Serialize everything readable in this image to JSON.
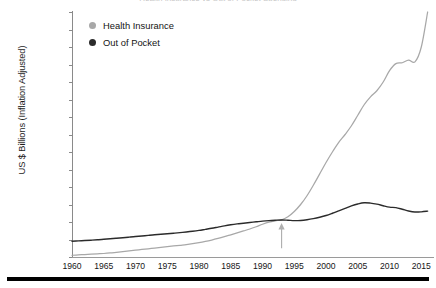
{
  "chart_data": {
    "type": "line",
    "title": "Health Insurance vs Out of Pocket Spending",
    "xlabel": "",
    "ylabel": "US $ Billions (Inflation Adjusted)",
    "xlim": [
      1960,
      2017
    ],
    "ylim": [
      0.0,
      280.0
    ],
    "grid": false,
    "legend_position": "top-left",
    "x_tick_labels": [
      "1960",
      "1965",
      "1970",
      "1975",
      "1980",
      "1985",
      "1990",
      "1995",
      "2000",
      "2005",
      "2010",
      "2015"
    ],
    "x_ticks": [
      1960,
      1965,
      1970,
      1975,
      1980,
      1985,
      1990,
      1995,
      2000,
      2005,
      2010,
      2015
    ],
    "y_tick_labels": [
      "$0.0",
      "$20.0",
      "$40.0",
      "$60.0",
      "$80.0",
      "$100.0",
      "$120.0",
      "$140.0",
      "$160.0",
      "$180.0",
      "$200.0",
      "$220.0",
      "$240.0",
      "$260.0",
      "$280.0"
    ],
    "y_ticks": [
      0,
      20,
      40,
      60,
      80,
      100,
      120,
      140,
      160,
      180,
      200,
      220,
      240,
      260,
      280
    ],
    "x": [
      1960,
      1961,
      1962,
      1963,
      1964,
      1965,
      1966,
      1967,
      1968,
      1969,
      1970,
      1971,
      1972,
      1973,
      1974,
      1975,
      1976,
      1977,
      1978,
      1979,
      1980,
      1981,
      1982,
      1983,
      1984,
      1985,
      1986,
      1987,
      1988,
      1989,
      1990,
      1991,
      1992,
      1993,
      1994,
      1995,
      1996,
      1997,
      1998,
      1999,
      2000,
      2001,
      2002,
      2003,
      2004,
      2005,
      2006,
      2007,
      2008,
      2009,
      2010,
      2011,
      2012,
      2013,
      2014,
      2015,
      2016
    ],
    "series": [
      {
        "name": "Health Insurance",
        "color": "#a8a8a8",
        "marker": "circle",
        "values": [
          2.0,
          2.4,
          2.8,
          3.2,
          3.6,
          4.0,
          4.6,
          5.4,
          6.2,
          7.0,
          7.8,
          8.6,
          9.4,
          10.2,
          11.0,
          11.8,
          12.6,
          13.4,
          14.2,
          15.2,
          16.4,
          17.8,
          19.4,
          21.2,
          23.2,
          25.4,
          27.6,
          29.8,
          32.0,
          34.6,
          37.4,
          39.8,
          41.4,
          42.5,
          46.0,
          52.0,
          60.0,
          70.0,
          82.0,
          95.0,
          108.0,
          120.0,
          131.0,
          140.0,
          150.0,
          162.0,
          174.0,
          183.0,
          190.0,
          200.0,
          213.0,
          221.0,
          222.0,
          225.0,
          223.0,
          240.0,
          280.0
        ]
      },
      {
        "name": "Out of Pocket",
        "color": "#2b2b2b",
        "marker": "circle",
        "values": [
          18.0,
          18.4,
          18.8,
          19.2,
          19.7,
          20.2,
          20.8,
          21.4,
          22.0,
          22.7,
          23.4,
          24.0,
          24.7,
          25.4,
          26.0,
          26.6,
          27.2,
          27.9,
          28.6,
          29.4,
          30.4,
          31.6,
          32.8,
          34.2,
          35.6,
          36.8,
          37.8,
          38.6,
          39.4,
          40.2,
          41.0,
          41.6,
          42.0,
          42.3,
          42.0,
          41.6,
          41.8,
          42.6,
          43.8,
          45.4,
          47.4,
          50.0,
          52.8,
          55.6,
          58.4,
          60.6,
          62.0,
          61.6,
          60.4,
          58.6,
          57.0,
          56.4,
          54.6,
          52.6,
          51.4,
          51.6,
          52.4
        ]
      }
    ],
    "annotations": [
      {
        "type": "arrow",
        "name": "crossover-arrow",
        "color": "#b0b0b0",
        "points_to_x": 1993,
        "points_to_y": 42.4,
        "tail_y": 10.0,
        "description": "Up arrow marking the crossover of Health Insurance and Out of Pocket spending near 1993"
      }
    ]
  },
  "legend": {
    "items": [
      {
        "label": "Health Insurance",
        "color": "#a8a8a8"
      },
      {
        "label": "Out of Pocket",
        "color": "#2b2b2b"
      }
    ]
  }
}
